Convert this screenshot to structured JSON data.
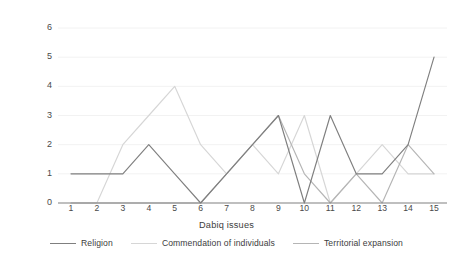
{
  "chart_data": {
    "type": "line",
    "title": "",
    "xlabel": "Dabiq issues",
    "ylabel": "Number of articles per issue",
    "categories": [
      1,
      2,
      3,
      4,
      5,
      6,
      7,
      8,
      9,
      10,
      11,
      12,
      13,
      14,
      15
    ],
    "xtick_labels": [
      "1",
      "2",
      "3",
      "4",
      "5",
      "6",
      "7",
      "8",
      "9",
      "10",
      "11",
      "12",
      "13",
      "14",
      "15"
    ],
    "ytick_labels": [
      "0",
      "1",
      "2",
      "3",
      "4",
      "5",
      "6"
    ],
    "ylim": [
      0,
      6
    ],
    "grid": true,
    "legend_position": "bottom",
    "series": [
      {
        "name": "Religion",
        "color": "#7f7f7f",
        "values": [
          1,
          1,
          1,
          2,
          1,
          0,
          1,
          2,
          3,
          0,
          3,
          1,
          1,
          2,
          5
        ]
      },
      {
        "name": "Commendation of individuals",
        "color": "#d6d6d6",
        "values": [
          0,
          0,
          2,
          3,
          4,
          2,
          1,
          2,
          1,
          3,
          0,
          1,
          2,
          1,
          1
        ]
      },
      {
        "name": "Territorial expansion",
        "color": "#b5b5b5",
        "values": [
          0,
          0,
          0,
          0,
          0,
          0,
          1,
          2,
          3,
          1,
          0,
          1,
          0,
          2,
          1
        ]
      }
    ]
  },
  "axis": {
    "ylabel": "Number of articles per issue",
    "xlabel": "Dabiq issues"
  },
  "legend": {
    "items": [
      {
        "label": "Religion"
      },
      {
        "label": "Commendation of individuals"
      },
      {
        "label": "Territorial expansion"
      }
    ]
  }
}
